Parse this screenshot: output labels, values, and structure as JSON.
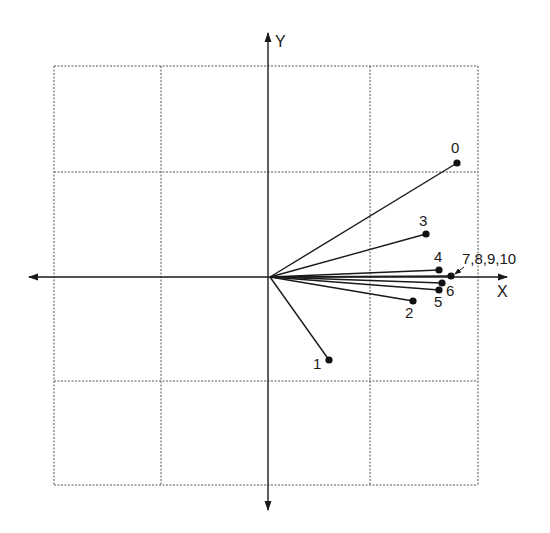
{
  "diagram": {
    "type": "vector-plot",
    "axes": {
      "x_label": "X",
      "y_label": "Y",
      "origin_px": [
        270,
        277
      ]
    },
    "grid": {
      "vertical_px": [
        54,
        161,
        370,
        478
      ],
      "horizontal_px": [
        66,
        172,
        381,
        485
      ],
      "bounds_px": {
        "left": 54,
        "right": 478,
        "top": 66,
        "bottom": 485
      }
    },
    "points": [
      {
        "id": "0",
        "label": "0",
        "px": [
          457,
          163
        ],
        "label_px": [
          451,
          153
        ]
      },
      {
        "id": "1",
        "label": "1",
        "px": [
          329,
          360
        ],
        "label_px": [
          313,
          369
        ]
      },
      {
        "id": "2",
        "label": "2",
        "px": [
          413,
          301
        ],
        "label_px": [
          405,
          318
        ]
      },
      {
        "id": "3",
        "label": "3",
        "px": [
          426,
          234
        ],
        "label_px": [
          419,
          226
        ]
      },
      {
        "id": "4",
        "label": "4",
        "px": [
          439,
          270
        ],
        "label_px": [
          434,
          262
        ]
      },
      {
        "id": "5",
        "label": "5",
        "px": [
          439,
          290
        ],
        "label_px": [
          434,
          307
        ]
      },
      {
        "id": "6",
        "label": "6",
        "px": [
          442,
          283
        ],
        "label_px": [
          446,
          296
        ]
      },
      {
        "id": "7-10",
        "label": "7,8,9,10",
        "px": [
          451,
          276
        ],
        "label_px": [
          462,
          264
        ],
        "leader": true
      }
    ]
  }
}
